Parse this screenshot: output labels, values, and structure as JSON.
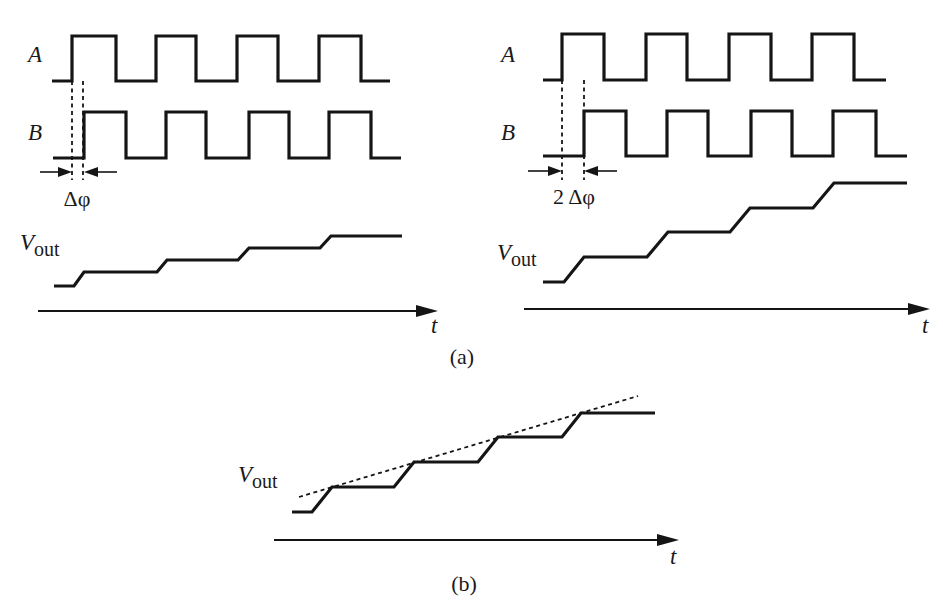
{
  "figure": {
    "width": 943,
    "height": 611,
    "background": "#ffffff",
    "ink_color": "#151515"
  },
  "panel_a_left": {
    "label_A": "A",
    "label_B": "B",
    "label_vout_main": "V",
    "label_vout_sub": "out",
    "label_t": "t",
    "phase_label": "Δφ",
    "signal_A_points": [
      [
        52,
        81
      ],
      [
        72,
        81
      ],
      [
        72,
        36
      ],
      [
        116,
        36
      ],
      [
        116,
        81
      ],
      [
        156,
        81
      ],
      [
        156,
        36
      ],
      [
        196,
        36
      ],
      [
        196,
        81
      ],
      [
        237,
        81
      ],
      [
        237,
        36
      ],
      [
        278,
        36
      ],
      [
        278,
        81
      ],
      [
        319,
        81
      ],
      [
        319,
        36
      ],
      [
        361,
        36
      ],
      [
        361,
        81
      ],
      [
        390,
        81
      ]
    ],
    "signal_B_points": [
      [
        53,
        158
      ],
      [
        84,
        158
      ],
      [
        84,
        112
      ],
      [
        126,
        112
      ],
      [
        126,
        158
      ],
      [
        166,
        158
      ],
      [
        166,
        112
      ],
      [
        206,
        112
      ],
      [
        206,
        158
      ],
      [
        249,
        158
      ],
      [
        249,
        112
      ],
      [
        289,
        112
      ],
      [
        289,
        158
      ],
      [
        329,
        158
      ],
      [
        329,
        112
      ],
      [
        371,
        112
      ],
      [
        371,
        158
      ],
      [
        401,
        158
      ]
    ],
    "vout_points": [
      [
        54,
        286
      ],
      [
        74,
        286
      ],
      [
        84,
        272
      ],
      [
        157,
        272
      ],
      [
        167,
        260
      ],
      [
        238,
        260
      ],
      [
        249,
        248
      ],
      [
        320,
        248
      ],
      [
        331,
        236
      ],
      [
        402,
        236
      ]
    ],
    "dashed_markers_x": [
      72,
      83
    ],
    "dashed_y_range": [
      81,
      180
    ],
    "arrow_y": 172,
    "arrow_left": {
      "from": 40,
      "to": 72
    },
    "arrow_right": {
      "from": 117,
      "to": 84
    },
    "axis": {
      "x1": 38,
      "x2": 438,
      "y": 311
    },
    "label_positions": {
      "A": [
        28,
        62
      ],
      "B": [
        28,
        140
      ],
      "vout": [
        20,
        250
      ],
      "t": [
        431,
        333
      ],
      "phase": [
        77,
        206
      ]
    }
  },
  "panel_a_right": {
    "label_A": "A",
    "label_B": "B",
    "label_vout_main": "V",
    "label_vout_sub": "out",
    "label_t": "t",
    "phase_label": "2 Δφ",
    "signal_A_points": [
      [
        543,
        80
      ],
      [
        562,
        80
      ],
      [
        562,
        34
      ],
      [
        604,
        34
      ],
      [
        604,
        80
      ],
      [
        646,
        80
      ],
      [
        646,
        34
      ],
      [
        687,
        34
      ],
      [
        687,
        80
      ],
      [
        729,
        80
      ],
      [
        729,
        34
      ],
      [
        771,
        34
      ],
      [
        771,
        80
      ],
      [
        812,
        80
      ],
      [
        812,
        34
      ],
      [
        854,
        34
      ],
      [
        854,
        80
      ],
      [
        886,
        80
      ]
    ],
    "signal_B_points": [
      [
        543,
        156
      ],
      [
        584,
        156
      ],
      [
        584,
        111
      ],
      [
        626,
        111
      ],
      [
        626,
        156
      ],
      [
        667,
        156
      ],
      [
        667,
        111
      ],
      [
        708,
        111
      ],
      [
        708,
        156
      ],
      [
        751,
        156
      ],
      [
        751,
        111
      ],
      [
        792,
        111
      ],
      [
        792,
        156
      ],
      [
        833,
        156
      ],
      [
        833,
        111
      ],
      [
        876,
        111
      ],
      [
        876,
        156
      ],
      [
        907,
        156
      ]
    ],
    "vout_points": [
      [
        543,
        282
      ],
      [
        564,
        282
      ],
      [
        584,
        257
      ],
      [
        647,
        257
      ],
      [
        668,
        232
      ],
      [
        730,
        232
      ],
      [
        750,
        208
      ],
      [
        813,
        208
      ],
      [
        834,
        183
      ],
      [
        907,
        183
      ]
    ],
    "dashed_markers_x": [
      562,
      584
    ],
    "dashed_y_range": [
      80,
      180
    ],
    "arrow_y": 171,
    "arrow_left": {
      "from": 528,
      "to": 562
    },
    "arrow_right": {
      "from": 617,
      "to": 584
    },
    "axis": {
      "x1": 524,
      "x2": 930,
      "y": 309
    },
    "label_positions": {
      "A": [
        501,
        62
      ],
      "B": [
        501,
        140
      ],
      "vout": [
        497,
        260
      ],
      "t": [
        922,
        333
      ],
      "phase": [
        574,
        204
      ]
    }
  },
  "panel_b": {
    "label_vout_main": "V",
    "label_vout_sub": "out",
    "label_t": "t",
    "vout_points": [
      [
        292,
        512
      ],
      [
        312,
        512
      ],
      [
        332,
        487
      ],
      [
        394,
        487
      ],
      [
        414,
        462
      ],
      [
        478,
        462
      ],
      [
        498,
        437
      ],
      [
        562,
        437
      ],
      [
        581,
        413
      ],
      [
        655,
        413
      ]
    ],
    "trend_line": {
      "x1": 299,
      "y1": 497,
      "x2": 638,
      "y2": 396
    },
    "axis": {
      "x1": 274,
      "x2": 679,
      "y": 540
    },
    "label_positions": {
      "vout": [
        238,
        482
      ],
      "t": [
        670,
        564
      ]
    }
  },
  "captions": {
    "a": "(a)",
    "b": "(b)",
    "a_pos": [
      462,
      364
    ],
    "b_pos": [
      464,
      591
    ]
  }
}
